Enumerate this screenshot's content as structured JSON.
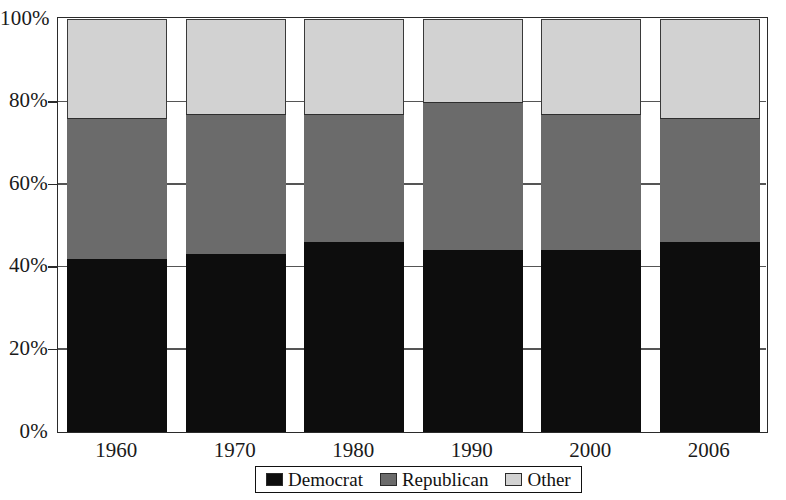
{
  "chart_data": {
    "type": "bar",
    "subtype": "stacked-100-percent",
    "title": "",
    "subtitle": "",
    "xlabel": "",
    "ylabel": "",
    "categories": [
      "1960",
      "1970",
      "1980",
      "1990",
      "2000",
      "2006"
    ],
    "series": [
      {
        "name": "Democrat",
        "color": "#0d0d0d",
        "values": [
          42,
          43,
          46,
          44,
          44,
          46
        ]
      },
      {
        "name": "Republican",
        "color": "#6b6b6b",
        "values": [
          34,
          34,
          31,
          36,
          33,
          30
        ]
      },
      {
        "name": "Other",
        "color": "#d2d2d2",
        "values": [
          24,
          23,
          23,
          20,
          23,
          24
        ]
      }
    ],
    "cumulative_tops": {
      "Democrat": [
        42,
        43,
        46,
        44,
        44,
        46
      ],
      "Republican": [
        76,
        77,
        77,
        80,
        77,
        76
      ],
      "Other": [
        100,
        100,
        100,
        100,
        100,
        100
      ]
    },
    "ylim": [
      0,
      100
    ],
    "ytick_values": [
      0,
      20,
      40,
      60,
      80,
      100
    ],
    "ytick_labels": [
      "0%",
      "20%",
      "40%",
      "60%",
      "80%",
      "100%"
    ],
    "grid": "y-dashes-only",
    "legend_position": "bottom-center",
    "legend_entries": [
      {
        "label": "Democrat",
        "swatch": "#0d0d0d"
      },
      {
        "label": "Republican",
        "swatch": "#6b6b6b"
      },
      {
        "label": "Other",
        "swatch": "#d2d2d2"
      }
    ]
  },
  "axes": {
    "y": {
      "ticks": [
        {
          "label": "100%",
          "value": 100
        },
        {
          "label": "80%",
          "value": 80
        },
        {
          "label": "60%",
          "value": 60
        },
        {
          "label": "40%",
          "value": 40
        },
        {
          "label": "20%",
          "value": 20
        },
        {
          "label": "0%",
          "value": 0
        }
      ]
    },
    "x": {
      "ticks": [
        {
          "label": "1960"
        },
        {
          "label": "1970"
        },
        {
          "label": "1980"
        },
        {
          "label": "1990"
        },
        {
          "label": "2000"
        },
        {
          "label": "2006"
        }
      ]
    }
  },
  "legend": {
    "items": [
      {
        "label": "Democrat"
      },
      {
        "label": "Republican"
      },
      {
        "label": "Other"
      }
    ]
  }
}
